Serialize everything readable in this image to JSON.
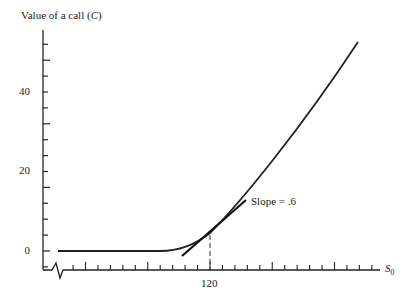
{
  "chart_data": {
    "type": "line",
    "title": "",
    "ylabel": "Value of a call (C)",
    "ylabel_text": "Value of a call (",
    "ylabel_var": "C",
    "ylabel_close": ")",
    "xlabel": "S0",
    "xlabel_var": "S",
    "xlabel_sub": "0",
    "yticks": [
      0,
      20,
      40
    ],
    "ytick_labels": [
      "0",
      "20",
      "40"
    ],
    "xticks": [
      120
    ],
    "xtick_labels": [
      "120"
    ],
    "ylim": [
      -5,
      56
    ],
    "xlim_note": "axis broken near origin",
    "grid": false,
    "series": [
      {
        "name": "Call value curve",
        "x": [
          76,
          100,
          108,
          112,
          116,
          120,
          126,
          136,
          156,
          176,
          200
        ],
        "y": [
          0,
          0,
          0.2,
          0.8,
          2.2,
          4.5,
          8.5,
          15.5,
          31,
          47,
          52.5
        ]
      },
      {
        "name": "Tangent at S0 = 120",
        "slope": 0.6,
        "x": [
          112,
          132
        ],
        "y": [
          -1.3,
          11.7
        ]
      }
    ],
    "annotations": [
      {
        "text": "Slope = .6",
        "x": 133,
        "y": 12
      },
      {
        "type": "dashed-vertical",
        "x": 120,
        "from_y": -5,
        "to_y": 4.5
      }
    ]
  }
}
